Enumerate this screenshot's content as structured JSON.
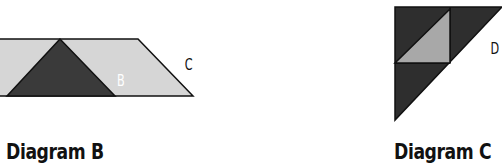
{
  "diagrams": [
    {
      "caption": "Diagram B",
      "regions": [
        {
          "label": "",
          "fill": "#d6d6d6"
        },
        {
          "label": "B",
          "fill": "#3a3a3a",
          "text_color": "#ffffff"
        },
        {
          "label": "C",
          "fill": "#d6d6d6",
          "text_color": "#111111"
        }
      ]
    },
    {
      "caption": "Diagram C",
      "regions": [
        {
          "label": "",
          "fill": "#2e2e2e"
        },
        {
          "label": "D",
          "fill": "#a8a8a8",
          "text_color": "#111111"
        }
      ]
    }
  ],
  "colors": {
    "outline": "#111111",
    "light_region": "#d6d6d6",
    "dark_region": "#333333",
    "mid_region": "#a8a8a8"
  }
}
